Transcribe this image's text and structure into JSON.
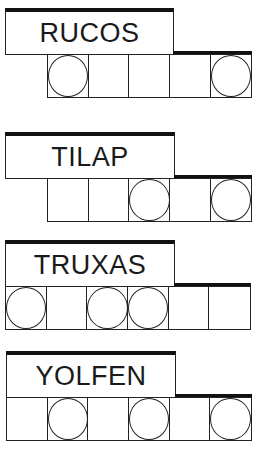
{
  "puzzles": [
    {
      "word": "RUCOS",
      "top": 8,
      "label": {
        "left": 5,
        "width": 169,
        "height": 47
      },
      "tiles_left": 47,
      "tile_count": 5,
      "circled": [
        true,
        false,
        false,
        false,
        true
      ]
    },
    {
      "word": "TILAP",
      "top": 132,
      "label": {
        "left": 5,
        "width": 170,
        "height": 47
      },
      "tiles_left": 47,
      "tile_count": 5,
      "circled": [
        false,
        false,
        true,
        false,
        true
      ]
    },
    {
      "word": "TRUXAS",
      "top": 240,
      "label": {
        "left": 5,
        "width": 170,
        "height": 47
      },
      "tiles_left": 5,
      "tile_count": 6,
      "circled": [
        true,
        false,
        true,
        true,
        false,
        false
      ]
    },
    {
      "word": "YOLFEN",
      "top": 351,
      "label": {
        "left": 6,
        "width": 170,
        "height": 47
      },
      "tiles_left": 6,
      "tile_count": 6,
      "circled": [
        false,
        true,
        false,
        true,
        false,
        true
      ]
    }
  ],
  "colors": {
    "line": "#222222",
    "background": "#ffffff",
    "text": "#1a1a1a"
  }
}
